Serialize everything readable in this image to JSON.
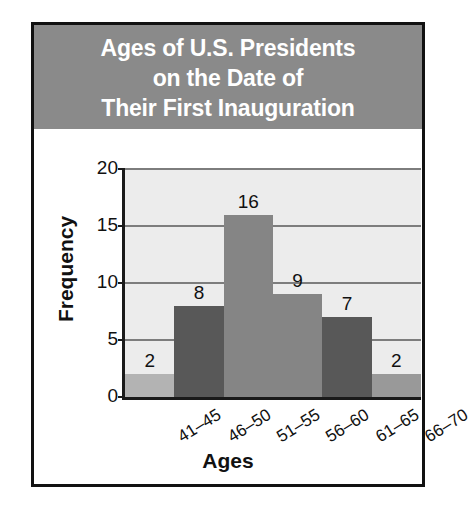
{
  "figure": {
    "title_lines": [
      "Ages of U.S. Presidents",
      "on the Date of",
      "Their First Inauguration"
    ],
    "banner_color": "#8a8a8a",
    "frame_color": "#111111",
    "plot_background": "#ececec",
    "gridline_color": "#7d7d7d",
    "axis_color": "#1a1a1a",
    "title_text_color": "#ffffff"
  },
  "chart_data": {
    "type": "bar",
    "title": "Ages of U.S. Presidents on the Date of Their First Inauguration",
    "xlabel": "Ages",
    "ylabel": "Frequency",
    "categories": [
      "41–45",
      "46–50",
      "51–55",
      "56–60",
      "61–65",
      "66–70"
    ],
    "values": [
      2,
      8,
      16,
      9,
      7,
      2
    ],
    "value_labels": [
      "2",
      "8",
      "16",
      "9",
      "7",
      "2"
    ],
    "bar_colors": [
      "#b3b3b3",
      "#585858",
      "#858585",
      "#858585",
      "#585858",
      "#999999"
    ],
    "ylim": [
      0,
      20
    ],
    "yticks": [
      0,
      5,
      10,
      15,
      20
    ],
    "ytick_labels": [
      "0",
      "5",
      "10",
      "15",
      "20"
    ],
    "grid": true,
    "legend": "none",
    "bar_gap": "none"
  }
}
